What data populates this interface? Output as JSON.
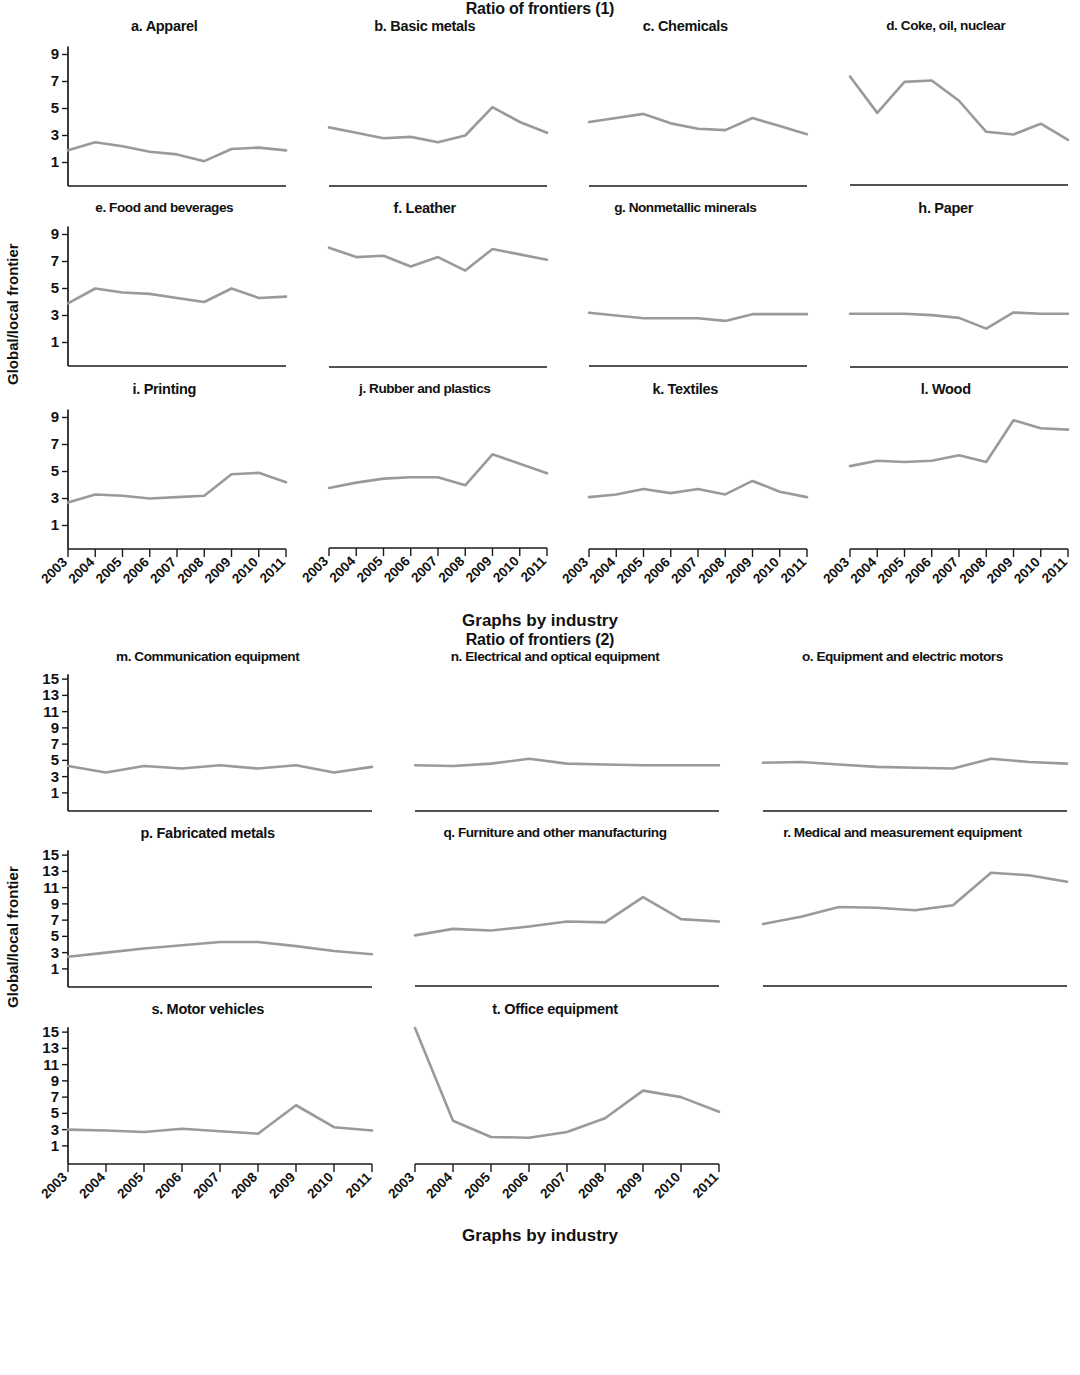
{
  "figure1": {
    "title": "Ratio of frontiers (1)",
    "ylabel": "Global/local frontier",
    "footer": "Graphs by industry"
  },
  "figure2": {
    "title": "Ratio of frontiers (2)",
    "ylabel": "Global/local frontier",
    "footer": "Graphs by industry"
  },
  "axis": {
    "years": [
      "2003",
      "2004",
      "2005",
      "2006",
      "2007",
      "2008",
      "2009",
      "2010",
      "2011"
    ],
    "yticks_1": [
      1,
      3,
      5,
      7,
      9
    ],
    "yticks_2": [
      1,
      3,
      5,
      7,
      9,
      11,
      13,
      15
    ],
    "ylim_1": [
      0,
      10
    ],
    "ylim_2": [
      0,
      16
    ],
    "line_color": "#9a9a9a",
    "axis_color": "#1a1a1a"
  },
  "chart_data": {
    "type": "line",
    "title": "Ratio of frontiers",
    "xlabel": "Graphs by industry",
    "ylabel": "Global/local frontier",
    "x": [
      "2003",
      "2004",
      "2005",
      "2006",
      "2007",
      "2008",
      "2009",
      "2010",
      "2011"
    ],
    "grid": false,
    "legend": "none",
    "panels_1": {
      "title": "Ratio of frontiers (1)",
      "ylim": [
        0,
        10
      ],
      "yticks": [
        1,
        3,
        5,
        7,
        9
      ],
      "series": [
        {
          "name": "a. Apparel",
          "values": [
            1.9,
            2.5,
            2.2,
            1.8,
            1.6,
            1.1,
            2.0,
            2.1,
            1.9
          ]
        },
        {
          "name": "b. Basic metals",
          "values": [
            3.6,
            3.2,
            2.8,
            2.9,
            2.5,
            3.0,
            5.1,
            4.0,
            3.2
          ]
        },
        {
          "name": "c. Chemicals",
          "values": [
            4.0,
            4.3,
            4.6,
            3.9,
            3.5,
            3.4,
            4.3,
            3.7,
            3.1
          ]
        },
        {
          "name": "d. Coke, oil, nuclear",
          "values": [
            7.3,
            4.6,
            6.9,
            7.0,
            5.5,
            3.2,
            3.0,
            3.8,
            2.6
          ]
        },
        {
          "name": "e. Food and beverages",
          "values": [
            3.9,
            5.0,
            4.7,
            4.6,
            4.3,
            4.0,
            5.0,
            4.3,
            4.4
          ]
        },
        {
          "name": "f. Leather",
          "values": [
            8.1,
            7.4,
            7.5,
            6.7,
            7.4,
            6.4,
            8.0,
            7.6,
            7.2
          ]
        },
        {
          "name": "g. Nonmetallic minerals",
          "values": [
            3.2,
            3.0,
            2.8,
            2.8,
            2.8,
            2.6,
            3.1,
            3.1,
            3.1
          ]
        },
        {
          "name": "h. Paper",
          "values": [
            3.2,
            3.2,
            3.2,
            3.1,
            2.9,
            2.1,
            3.3,
            3.2,
            3.2
          ]
        },
        {
          "name": "i. Printing",
          "values": [
            2.7,
            3.3,
            3.2,
            3.0,
            3.1,
            3.2,
            4.8,
            4.9,
            4.2
          ]
        },
        {
          "name": "j. Rubber and plastics",
          "values": [
            3.7,
            4.1,
            4.4,
            4.5,
            4.5,
            3.9,
            6.2,
            5.5,
            4.8
          ]
        },
        {
          "name": "k. Textiles",
          "values": [
            3.1,
            3.3,
            3.7,
            3.4,
            3.7,
            3.3,
            4.3,
            3.5,
            3.1
          ]
        },
        {
          "name": "l. Wood",
          "values": [
            5.4,
            5.8,
            5.7,
            5.8,
            6.2,
            5.7,
            8.8,
            8.2,
            8.1
          ]
        }
      ]
    },
    "panels_2": {
      "title": "Ratio of frontiers (2)",
      "ylim": [
        0,
        16
      ],
      "yticks": [
        1,
        3,
        5,
        7,
        9,
        11,
        13,
        15
      ],
      "series": [
        {
          "name": "m. Communication equipment",
          "values": [
            4.3,
            3.5,
            4.3,
            4.0,
            4.4,
            4.0,
            4.4,
            3.5,
            4.2
          ]
        },
        {
          "name": "n. Electrical and optical equipment",
          "values": [
            4.4,
            4.3,
            4.6,
            5.2,
            4.6,
            4.5,
            4.4,
            4.4,
            4.4
          ]
        },
        {
          "name": "o. Equipment and electric motors",
          "values": [
            4.7,
            4.8,
            4.5,
            4.2,
            4.1,
            4.0,
            5.2,
            4.8,
            4.6
          ]
        },
        {
          "name": "p. Fabricated metals",
          "values": [
            2.5,
            3.0,
            3.5,
            3.9,
            4.3,
            4.3,
            3.8,
            3.2,
            2.8
          ]
        },
        {
          "name": "q. Furniture and other manufacturing",
          "values": [
            5.0,
            5.8,
            5.6,
            6.1,
            6.7,
            6.6,
            9.7,
            7.0,
            6.7
          ]
        },
        {
          "name": "r. Medical and measurement equipment",
          "values": [
            6.4,
            7.3,
            8.5,
            8.4,
            8.1,
            8.7,
            12.7,
            12.4,
            11.6
          ]
        },
        {
          "name": "s. Motor vehicles",
          "values": [
            3.0,
            2.9,
            2.7,
            3.1,
            2.8,
            2.5,
            6.0,
            3.3,
            2.9
          ]
        },
        {
          "name": "t. Office equipment",
          "values": [
            15.5,
            4.1,
            2.1,
            2.0,
            2.7,
            4.4,
            7.8,
            7.0,
            5.2
          ]
        }
      ]
    }
  }
}
